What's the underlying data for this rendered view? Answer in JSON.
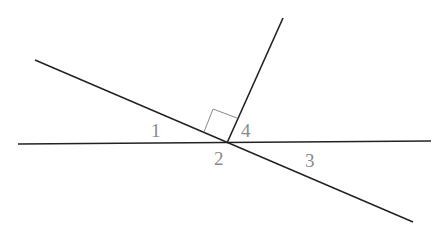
{
  "diagram": {
    "colors": {
      "line": "#222222",
      "right_angle_marker": "#8a8a8a",
      "label": "#8a8a8a",
      "background": "#ffffff"
    },
    "lines": {
      "horizontal": {
        "x1": 18,
        "y1": 144,
        "x2": 431,
        "y2": 141
      },
      "diagonal": {
        "x1": 35,
        "y1": 60,
        "x2": 413,
        "y2": 222
      },
      "ray": {
        "x1": 227,
        "y1": 143,
        "x2": 283,
        "y2": 18
      }
    },
    "right_angle_marker": {
      "points": "204,132 213,109 237,118"
    },
    "labels": [
      {
        "text": "1",
        "x": 151,
        "y": 137
      },
      {
        "text": "2",
        "x": 214,
        "y": 165
      },
      {
        "text": "3",
        "x": 305,
        "y": 167
      },
      {
        "text": "4",
        "x": 241,
        "y": 137
      }
    ]
  }
}
